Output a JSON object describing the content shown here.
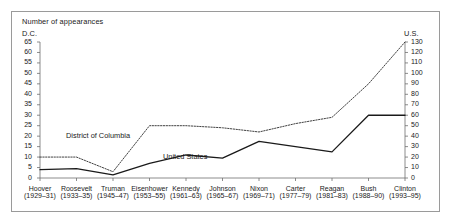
{
  "header": {
    "title": "Number of appearances",
    "left_axis_label": "D.C.",
    "right_axis_label": "U.S."
  },
  "series_labels": {
    "dc": "District of Columbia",
    "us": "United States"
  },
  "chart_data": {
    "type": "line",
    "title": "Number of appearances",
    "xlabel": "",
    "ylabel": "D.C.",
    "y2label": "U.S.",
    "grid": false,
    "legend": "inline-annotations",
    "categories": [
      "Hoover",
      "Roosevelt",
      "Truman",
      "Eisenhower",
      "Kennedy",
      "Johnson",
      "Nixon",
      "Carter",
      "Reagan",
      "Bush",
      "Clinton"
    ],
    "category_years": [
      "(1929–31)",
      "(1933–35)",
      "(1945–47)",
      "(1953–55)",
      "(1961–63)",
      "(1965–67)",
      "(1969–71)",
      "(1977–79)",
      "(1981–83)",
      "(1988–90)",
      "(1993–95)"
    ],
    "ylim": [
      0,
      65
    ],
    "yticks": [
      0,
      5,
      10,
      15,
      20,
      25,
      30,
      35,
      40,
      45,
      50,
      55,
      60,
      65
    ],
    "y2lim": [
      0,
      130
    ],
    "y2ticks": [
      0,
      10,
      20,
      30,
      40,
      50,
      60,
      70,
      80,
      90,
      100,
      110,
      120,
      130
    ],
    "series": [
      {
        "name": "District of Columbia",
        "style": "dotted",
        "color": "#2b2b2b",
        "axis": "left",
        "values": [
          10,
          10,
          3,
          25,
          25,
          24,
          22,
          26,
          29,
          45,
          65
        ]
      },
      {
        "name": "United States",
        "style": "solid",
        "color": "#1a1a1a",
        "axis": "right",
        "values": [
          8,
          9,
          3,
          14,
          22,
          19,
          35,
          30,
          25,
          60,
          60
        ]
      }
    ]
  },
  "colors": {
    "frame": "#9a9a9a",
    "axis": "#6f6f6f",
    "text": "#1a1a1a"
  }
}
